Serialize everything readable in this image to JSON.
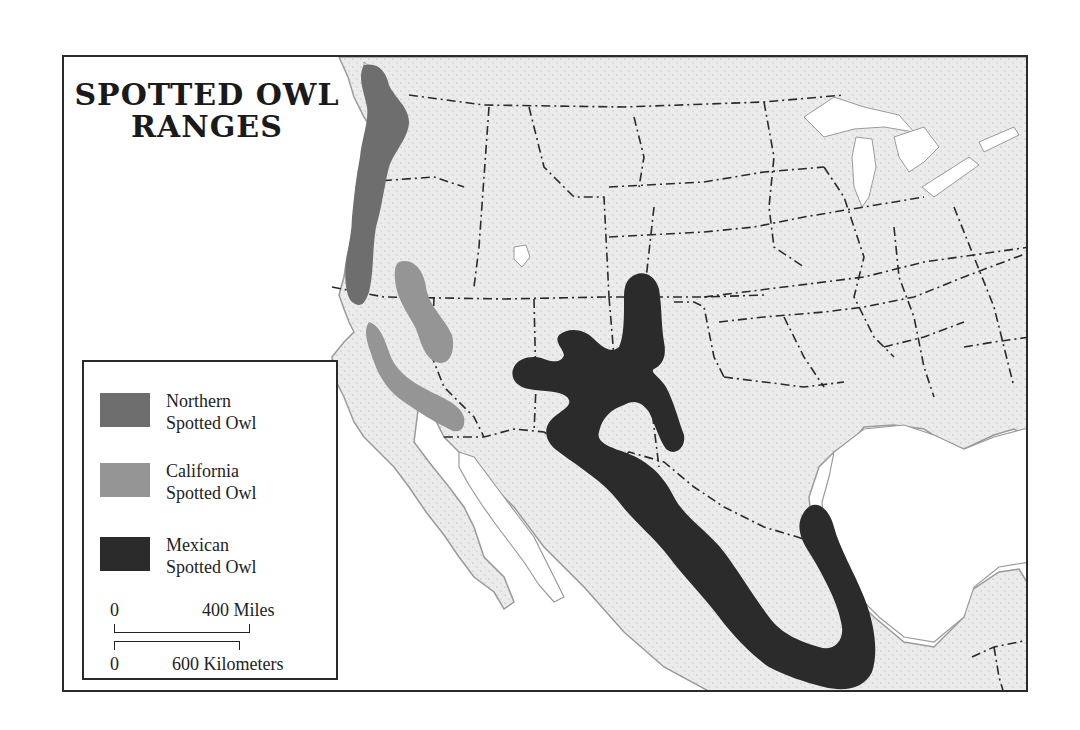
{
  "map": {
    "title_line1": "SPOTTED OWL",
    "title_line2": "RANGES",
    "region": "Western United States and Mexico"
  },
  "legend": {
    "items": [
      {
        "label_line1": "Northern",
        "label_line2": "Spotted Owl",
        "color": "#6e6e6e"
      },
      {
        "label_line1": "California",
        "label_line2": "Spotted Owl",
        "color": "#959595"
      },
      {
        "label_line1": "Mexican",
        "label_line2": "Spotted Owl",
        "color": "#2b2b2b"
      }
    ]
  },
  "scale": {
    "miles_zero": "0",
    "miles_label": "400 Miles",
    "km_zero": "0",
    "km_label": "600 Kilometers"
  },
  "colors": {
    "land": "#e9e9e9",
    "water": "#ffffff",
    "border": "#2a2a2a",
    "coast": "#9a9a9a"
  }
}
